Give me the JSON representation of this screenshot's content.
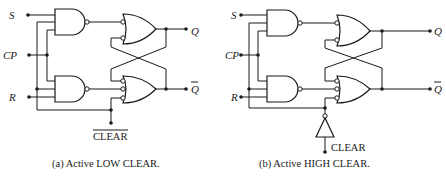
{
  "figure": {
    "panels": [
      {
        "id": "a",
        "caption": "(a)  Active  LOW CLEAR.",
        "inputs": {
          "s": "S",
          "cp": "CP",
          "r": "R"
        },
        "outputs": {
          "q": "Q",
          "qbar": "Q"
        },
        "clear_label": "CLEAR",
        "clear_label_overbar": true,
        "clear_type": "active-low"
      },
      {
        "id": "b",
        "caption": "(b)  Active  HIGH CLEAR.",
        "inputs": {
          "s": "S",
          "cp": "CP",
          "r": "R"
        },
        "outputs": {
          "q": "Q",
          "qbar": "Q"
        },
        "clear_label": "CLEAR",
        "clear_label_overbar": false,
        "clear_type": "active-high-with-inverter"
      }
    ],
    "gates": [
      "nand-2in",
      "nand-3in",
      "nor-2in-inverted-inputs",
      "nor-3in-inverted-inputs",
      "inverter"
    ],
    "colors": {
      "ink": "#1a1a1a",
      "background": "#ffffff"
    }
  }
}
